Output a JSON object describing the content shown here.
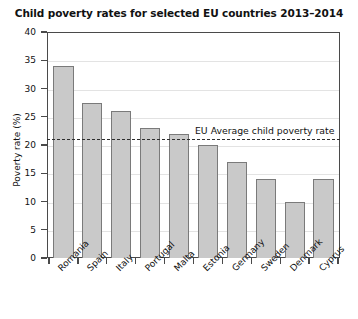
{
  "chart_data": {
    "type": "bar",
    "title": "Child poverty rates for selected EU countries 2013–2014",
    "xlabel": "",
    "ylabel": "Poverty rate (%)",
    "categories": [
      "Romania",
      "Spain",
      "Italy",
      "Portugal",
      "Malta",
      "Estonia",
      "Germany",
      "Sweden",
      "Denmark",
      "Cyprus"
    ],
    "values": [
      34,
      27.5,
      26,
      23,
      22,
      20,
      17,
      14,
      10,
      14
    ],
    "ylim": [
      0,
      40
    ],
    "yticks": [
      0,
      5,
      10,
      15,
      20,
      25,
      30,
      35,
      40
    ],
    "ytick_labels": [
      "0",
      "5",
      "10",
      "15",
      "20",
      "25",
      "30",
      "35",
      "40"
    ],
    "grid": true,
    "legend": false,
    "annotations": [
      {
        "name": "eu-average-line",
        "label": "EU Average child poverty rate",
        "value": 21,
        "style": "dashed horizontal reference line"
      }
    ],
    "colors": {
      "bar_fill": "#c9c9c9",
      "bar_stroke": "#7a7a7a",
      "axis": "#4a4a4a",
      "gridline": "#e3e3e3",
      "text": "#111111",
      "reference_line": "#2e2e2e",
      "background": "#ffffff"
    }
  }
}
